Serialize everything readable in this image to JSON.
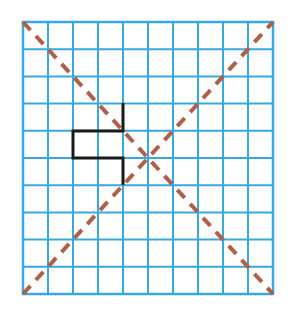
{
  "figure": {
    "canvas": {
      "width": 295,
      "height": 313,
      "background": "#ffffff"
    }
  },
  "chart_data": {
    "type": "scatter",
    "title": "",
    "subtitle": "",
    "xlabel": "",
    "ylabel": "",
    "grid": true,
    "legend_position": "none",
    "xlim": [
      0,
      10
    ],
    "ylim": [
      0,
      10
    ],
    "x": [],
    "values": [],
    "categories": [],
    "tick_labels_x": [],
    "tick_labels_y": [],
    "annotations": [],
    "grid_spec": {
      "columns": 10,
      "rows": 10,
      "origin_px": {
        "x": 23,
        "y": 22
      },
      "cell_width_px": 25,
      "cell_height_px": 27.2,
      "line_color": "#36a9e1",
      "line_width_px": 2,
      "border_color": "#36a9e1",
      "border_width_px": 2.5
    },
    "series": [
      {
        "name": "diagonal-down-right",
        "style": "dashed",
        "color": "#b06048",
        "width_px": 4,
        "dash_px": [
          11,
          8
        ],
        "points_cell": [
          [
            0,
            0
          ],
          [
            10,
            10
          ]
        ],
        "points_px": [
          [
            23,
            22
          ],
          [
            273,
            294
          ]
        ]
      },
      {
        "name": "diagonal-up-right",
        "style": "dashed",
        "color": "#b06048",
        "width_px": 4,
        "dash_px": [
          11,
          8
        ],
        "points_cell": [
          [
            0,
            10
          ],
          [
            10,
            0
          ]
        ],
        "points_px": [
          [
            23,
            294
          ],
          [
            273,
            22
          ]
        ]
      },
      {
        "name": "step-polyline",
        "style": "solid",
        "color": "#1a1a1a",
        "width_px": 3,
        "points_cell": [
          [
            4,
            3
          ],
          [
            4,
            4
          ],
          [
            2,
            4
          ],
          [
            2,
            5
          ],
          [
            4,
            5
          ],
          [
            4,
            6
          ]
        ],
        "points_px": [
          [
            123,
            103
          ],
          [
            123,
            131
          ],
          [
            73,
            131
          ],
          [
            73,
            158
          ],
          [
            123,
            158
          ],
          [
            123,
            185
          ]
        ]
      }
    ]
  },
  "colors": {
    "grid_blue": "#36a9e1",
    "diagonal_red": "#b06048",
    "shape_black": "#1a1a1a",
    "background_white": "#ffffff"
  }
}
